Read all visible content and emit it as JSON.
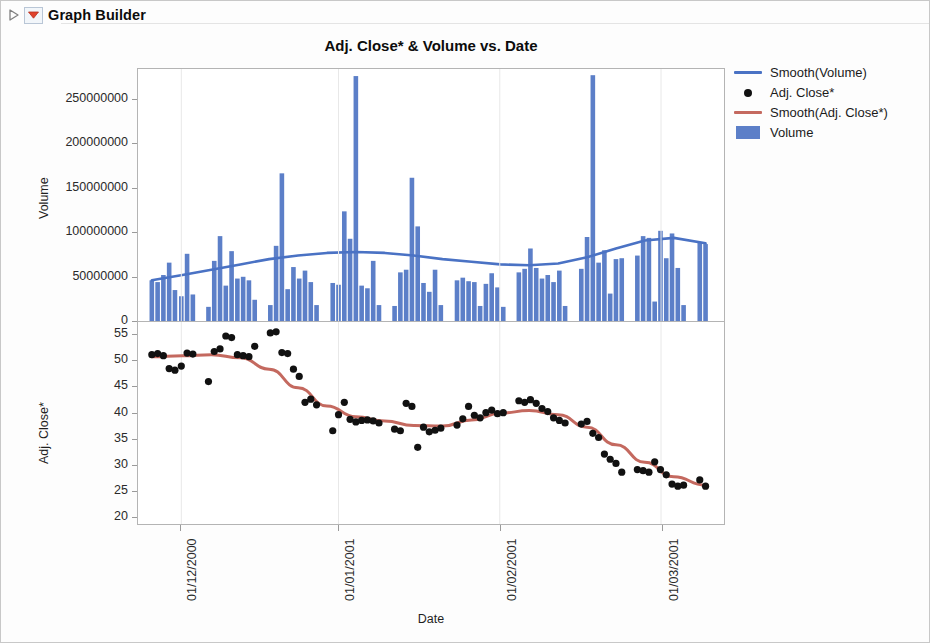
{
  "outline": {
    "title": "Graph Builder",
    "disclosure_icon": "triangle-collapse-icon",
    "menu_icon": "red-triangle-menu-icon"
  },
  "chart_title": "Adj. Close* & Volume vs. Date",
  "legend": {
    "items": [
      {
        "label": "Smooth(Volume)",
        "key": "line",
        "color": "#4A72C4",
        "icon": "line-swatch-icon"
      },
      {
        "label": "Adj. Close*",
        "key": "dot",
        "color": "#111111",
        "icon": "dot-swatch-icon"
      },
      {
        "label": "Smooth(Adj. Close*)",
        "key": "line",
        "color": "#C4695F",
        "icon": "line-swatch-icon"
      },
      {
        "label": "Volume",
        "key": "rect",
        "color": "#5C7FC8",
        "icon": "rect-swatch-icon"
      }
    ]
  },
  "axes": {
    "x": {
      "title": "Date",
      "ticks": [
        "01/12/2000",
        "01/01/2001",
        "01/02/2001",
        "01/03/2001"
      ],
      "tick_positions_frac": [
        0.068,
        0.34,
        0.619,
        0.898
      ],
      "domain_start": "2000-11-13",
      "domain_end": "2001-03-05"
    },
    "volume": {
      "title": "Volume",
      "ticks": [
        "0",
        "50000000",
        "100000000",
        "150000000",
        "200000000",
        "250000000"
      ],
      "min": 0,
      "max": 285000000
    },
    "close": {
      "title": "Adj. Close*",
      "ticks": [
        "20",
        "25",
        "30",
        "35",
        "40",
        "45",
        "50",
        "55"
      ],
      "min": 18.5,
      "max": 57.5
    }
  },
  "chart_data": [
    {
      "type": "bar",
      "title": "Volume",
      "ylabel": "Volume",
      "xlabel": "Date",
      "ylim": [
        0,
        285000000
      ],
      "grid": false,
      "legend_position": "right",
      "x": [
        0.017,
        0.027,
        0.037,
        0.047,
        0.057,
        0.068,
        0.078,
        0.088,
        0.115,
        0.125,
        0.135,
        0.145,
        0.155,
        0.165,
        0.175,
        0.185,
        0.195,
        0.222,
        0.232,
        0.242,
        0.252,
        0.262,
        0.272,
        0.282,
        0.292,
        0.302,
        0.33,
        0.34,
        0.35,
        0.36,
        0.37,
        0.38,
        0.39,
        0.4,
        0.41,
        0.437,
        0.447,
        0.457,
        0.467,
        0.477,
        0.487,
        0.497,
        0.507,
        0.517,
        0.545,
        0.555,
        0.565,
        0.575,
        0.585,
        0.595,
        0.605,
        0.615,
        0.625,
        0.652,
        0.662,
        0.672,
        0.682,
        0.692,
        0.702,
        0.712,
        0.722,
        0.732,
        0.76,
        0.77,
        0.78,
        0.79,
        0.8,
        0.81,
        0.82,
        0.83,
        0.857,
        0.867,
        0.877,
        0.887,
        0.897,
        0.907,
        0.917,
        0.927,
        0.937,
        0.965,
        0.975
      ],
      "values": [
        46000000,
        44000000,
        52000000,
        66000000,
        35000000,
        28000000,
        76000000,
        30000000,
        16000000,
        68000000,
        96000000,
        40000000,
        79000000,
        48000000,
        50000000,
        46000000,
        24000000,
        18000000,
        85000000,
        167000000,
        36000000,
        61000000,
        48000000,
        57000000,
        44000000,
        18000000,
        43000000,
        41000000,
        124000000,
        93000000,
        277000000,
        40000000,
        37000000,
        68000000,
        18000000,
        17000000,
        55000000,
        58000000,
        162000000,
        107000000,
        43000000,
        33000000,
        58000000,
        18000000,
        46000000,
        49000000,
        45000000,
        44000000,
        17000000,
        42000000,
        54000000,
        38000000,
        16000000,
        55000000,
        59000000,
        82000000,
        60000000,
        48000000,
        52000000,
        44000000,
        57000000,
        17000000,
        59000000,
        95000000,
        278000000,
        66000000,
        80000000,
        31000000,
        70000000,
        71000000,
        74000000,
        96000000,
        94000000,
        22000000,
        102000000,
        71000000,
        99000000,
        60000000,
        18000000,
        89000000,
        87000000
      ],
      "smooth_name": "Smooth(Volume)",
      "smooth_color": "#4A72C4",
      "smooth_x": [
        0.017,
        0.07,
        0.12,
        0.17,
        0.22,
        0.27,
        0.32,
        0.37,
        0.42,
        0.47,
        0.52,
        0.57,
        0.62,
        0.67,
        0.72,
        0.77,
        0.82,
        0.87,
        0.92,
        0.975
      ],
      "smooth_y": [
        46000000,
        52000000,
        58000000,
        64000000,
        70000000,
        74000000,
        77000000,
        78000000,
        77000000,
        74000000,
        70000000,
        67000000,
        64000000,
        63000000,
        65000000,
        72000000,
        82000000,
        91000000,
        94000000,
        88000000
      ],
      "bar_color": "#5C7FC8"
    },
    {
      "type": "scatter",
      "title": "Adj. Close*",
      "ylabel": "Adj. Close*",
      "xlabel": "Date",
      "ylim": [
        18.5,
        57.5
      ],
      "grid": false,
      "point_color": "#111111",
      "x": [
        0.017,
        0.027,
        0.037,
        0.047,
        0.057,
        0.068,
        0.078,
        0.088,
        0.115,
        0.125,
        0.135,
        0.145,
        0.155,
        0.165,
        0.175,
        0.185,
        0.195,
        0.222,
        0.232,
        0.242,
        0.252,
        0.262,
        0.272,
        0.282,
        0.292,
        0.302,
        0.33,
        0.34,
        0.35,
        0.36,
        0.37,
        0.38,
        0.39,
        0.4,
        0.41,
        0.437,
        0.447,
        0.457,
        0.467,
        0.477,
        0.487,
        0.497,
        0.507,
        0.517,
        0.545,
        0.555,
        0.565,
        0.575,
        0.585,
        0.595,
        0.605,
        0.615,
        0.625,
        0.652,
        0.662,
        0.672,
        0.682,
        0.692,
        0.702,
        0.712,
        0.722,
        0.732,
        0.76,
        0.77,
        0.78,
        0.79,
        0.8,
        0.81,
        0.82,
        0.83,
        0.857,
        0.867,
        0.877,
        0.887,
        0.897,
        0.907,
        0.917,
        0.927,
        0.937,
        0.965,
        0.975
      ],
      "values": [
        51.2,
        51.4,
        51.0,
        48.5,
        48.2,
        49.0,
        51.5,
        51.3,
        46.0,
        51.8,
        52.3,
        54.8,
        54.5,
        51.2,
        51.0,
        50.8,
        52.8,
        55.4,
        55.6,
        51.6,
        51.4,
        48.4,
        47.0,
        42.0,
        42.6,
        41.5,
        36.5,
        39.6,
        42.0,
        38.7,
        38.2,
        38.5,
        38.6,
        38.4,
        38.0,
        36.8,
        36.5,
        41.8,
        41.2,
        33.3,
        37.2,
        36.3,
        36.6,
        37.0,
        37.6,
        38.8,
        41.2,
        39.5,
        39.0,
        40.0,
        40.5,
        39.8,
        40.0,
        42.3,
        42.0,
        42.5,
        41.8,
        40.8,
        40.2,
        39.0,
        38.5,
        38.0,
        37.8,
        38.3,
        36.0,
        35.2,
        32.0,
        31.0,
        30.2,
        28.5,
        29.0,
        28.8,
        28.5,
        30.5,
        29.0,
        28.0,
        26.2,
        25.8,
        26.0,
        27.0,
        25.8
      ],
      "smooth_name": "Smooth(Adj. Close*)",
      "smooth_color": "#C4695F",
      "smooth_x": [
        0.017,
        0.07,
        0.12,
        0.17,
        0.22,
        0.27,
        0.32,
        0.37,
        0.42,
        0.47,
        0.52,
        0.57,
        0.62,
        0.67,
        0.72,
        0.77,
        0.82,
        0.87,
        0.92,
        0.975
      ],
      "smooth_y": [
        50.8,
        51.0,
        51.2,
        50.6,
        48.4,
        44.8,
        41.3,
        39.2,
        38.4,
        37.5,
        37.4,
        38.6,
        39.9,
        40.4,
        39.6,
        37.2,
        33.8,
        30.4,
        27.6,
        26.0
      ]
    }
  ]
}
